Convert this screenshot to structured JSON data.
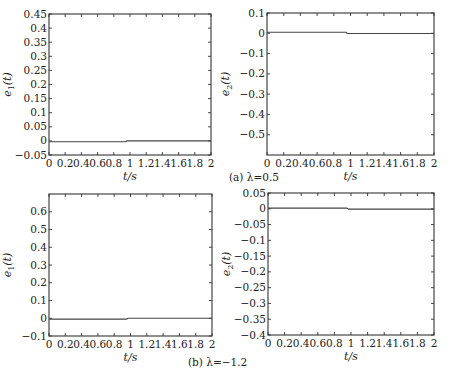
{
  "figure": {
    "captions": {
      "a": "(a) λ=0.5",
      "b": "(b) λ=−1.2"
    }
  },
  "chart_data": [
    {
      "id": "a-e1",
      "type": "line",
      "panel": "(a) λ=0.5",
      "title": "",
      "xlabel": "t/s",
      "ylabel": "e1(t)",
      "xlim": [
        0,
        2
      ],
      "ylim": [
        -0.05,
        0.45
      ],
      "xticks": [
        "0",
        "0.2",
        "0.4",
        "0.6",
        "0.8",
        "1",
        "1.2",
        "1.4",
        "1.6",
        "1.8",
        "2"
      ],
      "yticks": [
        "-0.05",
        "0",
        "0.05",
        "0.1",
        "0.15",
        "0.2",
        "0.25",
        "0.3",
        "0.35",
        "0.4",
        "0.45"
      ],
      "grid": false,
      "series": [
        {
          "name": "e1",
          "x": [
            0,
            0.95,
            0.96,
            2
          ],
          "y": [
            -0.003,
            -0.003,
            0.0,
            0.0
          ]
        }
      ],
      "box": {
        "x0": 49,
        "y0": 14,
        "x1": 211,
        "y1": 155
      }
    },
    {
      "id": "a-e2",
      "type": "line",
      "panel": "(a) λ=0.5",
      "title": "",
      "xlabel": "t/s",
      "ylabel": "e2(t)",
      "xlim": [
        0,
        2
      ],
      "ylim": [
        -0.6,
        0.1
      ],
      "xticks": [
        "0",
        "0.2",
        "0.4",
        "0.6",
        "0.8",
        "1",
        "1.2",
        "1.4",
        "1.6",
        "1.8",
        "2"
      ],
      "yticks": [
        "-0.5",
        "-0.4",
        "-0.3",
        "-0.2",
        "-0.1",
        "0",
        "0.1"
      ],
      "grid": false,
      "series": [
        {
          "name": "e2",
          "x": [
            0,
            0.95,
            0.96,
            2
          ],
          "y": [
            0.005,
            0.005,
            -0.001,
            -0.001
          ]
        }
      ],
      "box": {
        "x0": 267,
        "y0": 13,
        "x1": 434,
        "y1": 155
      }
    },
    {
      "id": "b-e1",
      "type": "line",
      "panel": "(b) λ=−1.2",
      "title": "",
      "xlabel": "t/s",
      "ylabel": "e1(t)",
      "xlim": [
        0,
        2
      ],
      "ylim": [
        -0.1,
        0.7
      ],
      "xticks": [
        "0",
        "0.2",
        "0.4",
        "0.6",
        "0.8",
        "1",
        "1.2",
        "1.4",
        "1.6",
        "1.8",
        "2"
      ],
      "yticks": [
        "-0.1",
        "0",
        "0.1",
        "0.2",
        "0.3",
        "0.4",
        "0.5",
        "0.6"
      ],
      "grid": false,
      "series": [
        {
          "name": "e1",
          "x": [
            0,
            0.95,
            0.97,
            2
          ],
          "y": [
            -0.005,
            -0.005,
            0.0,
            0.0
          ]
        }
      ],
      "box": {
        "x0": 49,
        "y0": 194,
        "x1": 212,
        "y1": 336
      }
    },
    {
      "id": "b-e2",
      "type": "line",
      "panel": "(b) λ=−1.2",
      "title": "",
      "xlabel": "t/s",
      "ylabel": "e2(t)",
      "xlim": [
        0,
        2
      ],
      "ylim": [
        -0.4,
        0.05
      ],
      "xticks": [
        "0",
        "0.2",
        "0.4",
        "0.6",
        "0.8",
        "1",
        "1.2",
        "1.4",
        "1.6",
        "1.8",
        "2"
      ],
      "yticks": [
        "-0.4",
        "-0.35",
        "-0.3",
        "-0.25",
        "-0.2",
        "-0.15",
        "-0.1",
        "-0.05",
        "0",
        "0.05"
      ],
      "grid": false,
      "series": [
        {
          "name": "e2",
          "x": [
            0,
            0.95,
            0.97,
            2
          ],
          "y": [
            0.002,
            0.002,
            -0.001,
            -0.001
          ]
        }
      ],
      "box": {
        "x0": 268,
        "y0": 193,
        "x1": 434,
        "y1": 335
      }
    }
  ]
}
